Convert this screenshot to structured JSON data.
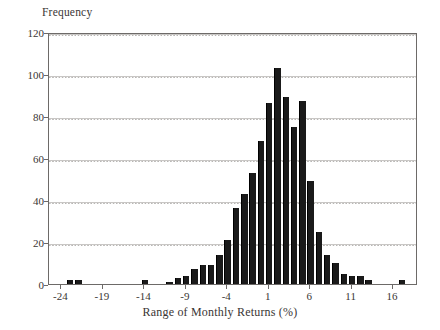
{
  "chart_data": {
    "type": "bar",
    "title": "",
    "xlabel": "Range of Monthly Returns (%)",
    "ylabel": "Frequency",
    "xlim": [
      -25.5,
      19.0
    ],
    "ylim": [
      0,
      120
    ],
    "grid": true,
    "legend": null,
    "bin_width": 1,
    "xticks": [
      -24,
      -19,
      -14,
      -9,
      -4,
      1,
      6,
      11,
      16
    ],
    "xtick_labels": [
      "-24",
      "-19",
      "-14",
      "-9",
      "-4",
      "1",
      "6",
      "11",
      "16"
    ],
    "yticks": [
      0,
      20,
      40,
      60,
      80,
      100,
      120
    ],
    "ytick_labels": [
      "0",
      "20",
      "40",
      "60",
      "80",
      "100",
      "120"
    ],
    "categories": [
      -23,
      -22,
      -14,
      -11,
      -10,
      -9,
      -8,
      -7,
      -6,
      -5,
      -4,
      -3,
      -2,
      -1,
      0,
      1,
      2,
      3,
      4,
      5,
      6,
      7,
      8,
      9,
      10,
      11,
      12,
      13,
      17
    ],
    "values": [
      2,
      2,
      2,
      1,
      3,
      4,
      7,
      9,
      9,
      14,
      21,
      36,
      43,
      53,
      68,
      86,
      103,
      89,
      75,
      87,
      49,
      25,
      14,
      10,
      5,
      4,
      4,
      2,
      2
    ],
    "bar_color": "#1a1a1a",
    "grid_color": "#c9c7c5",
    "axis_color": "#6d6a68"
  }
}
